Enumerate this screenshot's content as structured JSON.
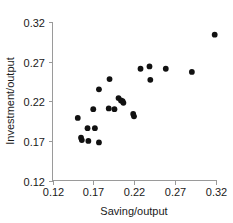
{
  "chart_data": {
    "type": "scatter",
    "title": "",
    "xlabel": "Saving/output",
    "ylabel": "Investment/output",
    "xlim": [
      0.12,
      0.32
    ],
    "ylim": [
      0.12,
      0.32
    ],
    "xticks": [
      "0.12",
      "0.17",
      "0.22",
      "0.27",
      "0.32"
    ],
    "yticks": [
      "0.12",
      "0.17",
      "0.22",
      "0.27",
      "0.32"
    ],
    "xtick_values": [
      0.12,
      0.17,
      0.22,
      0.27,
      0.32
    ],
    "ytick_values": [
      0.12,
      0.17,
      0.22,
      0.27,
      0.32
    ],
    "grid": false,
    "legend": null,
    "marker": "filled-circle",
    "marker_color": "#111111",
    "points": [
      {
        "x": 0.151,
        "y": 0.199
      },
      {
        "x": 0.155,
        "y": 0.174
      },
      {
        "x": 0.156,
        "y": 0.171
      },
      {
        "x": 0.163,
        "y": 0.186
      },
      {
        "x": 0.164,
        "y": 0.17
      },
      {
        "x": 0.172,
        "y": 0.186
      },
      {
        "x": 0.17,
        "y": 0.21
      },
      {
        "x": 0.177,
        "y": 0.168
      },
      {
        "x": 0.177,
        "y": 0.235
      },
      {
        "x": 0.189,
        "y": 0.211
      },
      {
        "x": 0.19,
        "y": 0.248
      },
      {
        "x": 0.196,
        "y": 0.21
      },
      {
        "x": 0.201,
        "y": 0.224
      },
      {
        "x": 0.204,
        "y": 0.221
      },
      {
        "x": 0.206,
        "y": 0.22
      },
      {
        "x": 0.207,
        "y": 0.218
      },
      {
        "x": 0.219,
        "y": 0.204
      },
      {
        "x": 0.22,
        "y": 0.201
      },
      {
        "x": 0.228,
        "y": 0.261
      },
      {
        "x": 0.239,
        "y": 0.264
      },
      {
        "x": 0.24,
        "y": 0.247
      },
      {
        "x": 0.259,
        "y": 0.261
      },
      {
        "x": 0.291,
        "y": 0.257
      },
      {
        "x": 0.319,
        "y": 0.304
      }
    ]
  },
  "axes": {
    "x_title": "Saving/output",
    "y_title": "Investment/output"
  }
}
